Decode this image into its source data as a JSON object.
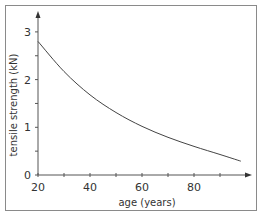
{
  "chart_data": {
    "type": "line",
    "title": "",
    "xlabel": "age (years)",
    "ylabel": "tensile strength (kN)",
    "xlim": [
      20,
      100
    ],
    "ylim": [
      0,
      3.3
    ],
    "x_ticks_major": [
      20,
      40,
      60,
      80
    ],
    "x_ticks_minor": [
      30,
      50,
      70,
      90
    ],
    "y_ticks_major": [
      0,
      1,
      2,
      3
    ],
    "y_ticks_minor": [
      0.5,
      1.5,
      2.5
    ],
    "grid": false,
    "legend": null,
    "series": [
      {
        "name": "tensile strength",
        "x": [
          20,
          30,
          40,
          50,
          60,
          70,
          80,
          90,
          98
        ],
        "y": [
          2.8,
          2.17,
          1.68,
          1.31,
          1.02,
          0.79,
          0.6,
          0.43,
          0.29
        ]
      }
    ]
  },
  "axes": {
    "x_tick_labels": [
      "20",
      "40",
      "60",
      "80"
    ],
    "y_tick_labels": [
      "0",
      "1",
      "2",
      "3"
    ]
  }
}
